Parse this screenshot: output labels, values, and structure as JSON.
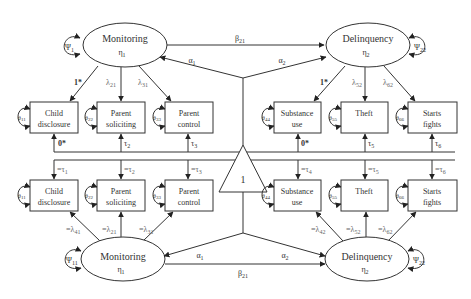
{
  "diagram": {
    "type": "structural-equation-model (longitudinal measurement invariance)",
    "mean_structure_node": {
      "label": "1",
      "shape": "triangle"
    },
    "time1": {
      "latents": [
        {
          "id": "monitoring",
          "name": "Monitoring",
          "symbol": "η",
          "subscript": "1",
          "variance": "Ψ",
          "variance_sub": "1"
        },
        {
          "id": "delinquency",
          "name": "Delinquency",
          "symbol": "η",
          "subscript": "2",
          "variance": "Ψ",
          "variance_sub": "22"
        }
      ],
      "indicators": [
        {
          "line1": "Child",
          "line2": "disclosure",
          "error": "θ",
          "error_sub": "11",
          "loading": "1*",
          "intercept": "0*"
        },
        {
          "line1": "Parent",
          "line2": "soliciting",
          "error": "θ",
          "error_sub": "22",
          "loading": "λ",
          "loading_sub": "21",
          "intercept": "τ",
          "intercept_sub": "2"
        },
        {
          "line1": "Parent",
          "line2": "control",
          "error": "θ",
          "error_sub": "33",
          "loading": "λ",
          "loading_sub": "31",
          "intercept": "τ",
          "intercept_sub": "3"
        },
        {
          "line1": "Substance",
          "line2": "use",
          "error": "θ",
          "error_sub": "44",
          "loading": "1*",
          "intercept": "0*"
        },
        {
          "line1": "Theft",
          "line2": "",
          "error": "θ",
          "error_sub": "55",
          "loading": "λ",
          "loading_sub": "52",
          "intercept": "τ",
          "intercept_sub": "5"
        },
        {
          "line1": "Starts",
          "line2": "fights",
          "error": "θ",
          "error_sub": "66",
          "loading": "λ",
          "loading_sub": "62",
          "intercept": "τ",
          "intercept_sub": "6"
        }
      ],
      "paths": {
        "beta": "β",
        "beta_sub": "21",
        "alpha1": "α",
        "alpha1_sub": "1",
        "alpha2": "α",
        "alpha2_sub": "2"
      }
    },
    "time2": {
      "latents": [
        {
          "id": "monitoring",
          "name": "Monitoring",
          "symbol": "η",
          "subscript": "1",
          "variance": "Ψ",
          "variance_sub": "11"
        },
        {
          "id": "delinquency",
          "name": "Delinquency",
          "symbol": "η",
          "subscript": "2",
          "variance": "Ψ",
          "variance_sub": "22"
        }
      ],
      "indicators": [
        {
          "line1": "Child",
          "line2": "disclosure",
          "error": "θ",
          "error_sub": "11",
          "loading": "=λ",
          "loading_sub": "41",
          "intercept": "=τ",
          "intercept_sub": "1"
        },
        {
          "line1": "Parent",
          "line2": "soliciting",
          "error": "θ",
          "error_sub": "22",
          "loading": "=λ",
          "loading_sub": "21",
          "intercept": "=τ",
          "intercept_sub": "2"
        },
        {
          "line1": "Parent",
          "line2": "control",
          "error": "θ",
          "error_sub": "33",
          "loading": "=λ",
          "loading_sub": "31",
          "intercept": "=τ",
          "intercept_sub": "3"
        },
        {
          "line1": "Substance",
          "line2": "use",
          "error": "θ",
          "error_sub": "44",
          "loading": "=λ",
          "loading_sub": "42",
          "intercept": "=τ",
          "intercept_sub": "4"
        },
        {
          "line1": "Theft",
          "line2": "",
          "error": "θ",
          "error_sub": "55",
          "loading": "=λ",
          "loading_sub": "52",
          "intercept": "=τ",
          "intercept_sub": "5"
        },
        {
          "line1": "Starts",
          "line2": "fights",
          "error": "θ",
          "error_sub": "66",
          "loading": "=λ",
          "loading_sub": "62",
          "intercept": "=τ",
          "intercept_sub": "6"
        }
      ],
      "paths": {
        "beta": "β",
        "beta_sub": "21",
        "alpha1": "α",
        "alpha1_sub": "1",
        "alpha2": "α",
        "alpha2_sub": "2"
      }
    }
  }
}
